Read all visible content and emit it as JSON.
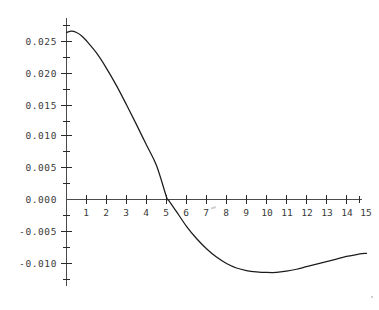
{
  "chart_data": {
    "type": "line",
    "title": "",
    "subtitle": "",
    "xlabel": "",
    "ylabel": "",
    "xlim": [
      0,
      15.2
    ],
    "ylim": [
      -0.0125,
      0.0275
    ],
    "grid": false,
    "legend": null,
    "legend_position": "none",
    "background_color": "#ffffff",
    "axis_color": "#4a4a4a",
    "tick_color": "#2a2a2a",
    "label_color": "#3a3a3a",
    "line_color": "#1c1c1c",
    "x_ticks": [
      1,
      2,
      3,
      4,
      5,
      6,
      7,
      8,
      9,
      10,
      11,
      12,
      13,
      14,
      15
    ],
    "x_tick_labels": [
      "1",
      "2",
      "3",
      "4",
      "5",
      "6",
      "7",
      "8",
      "9",
      "10",
      "11",
      "12",
      "13",
      "14",
      "15"
    ],
    "y_ticks": [
      -0.01,
      -0.005,
      0.0,
      0.005,
      0.01,
      0.015,
      0.02,
      0.025
    ],
    "y_tick_labels": [
      "-0.010",
      "-0.005",
      "0.000",
      "0.005",
      "0.010",
      "0.015",
      "0.020",
      "0.025"
    ],
    "y_minor_ticks": [
      -0.0125,
      -0.0075,
      -0.0025,
      0.0025,
      0.0075,
      0.0125,
      0.0175,
      0.0225,
      0.0265
    ],
    "zero_crossing_x": 5.1,
    "minimum": {
      "x": 10.5,
      "y": -0.0114
    },
    "maximum": {
      "x": 0.25,
      "y": 0.0263
    },
    "series": [
      {
        "name": "curve",
        "color": "#1c1c1c",
        "x": [
          0.0,
          0.25,
          0.5,
          0.75,
          1.0,
          1.5,
          2.0,
          2.5,
          3.0,
          3.5,
          4.0,
          4.5,
          5.0,
          5.1,
          5.5,
          6.0,
          6.5,
          7.0,
          7.5,
          8.0,
          8.5,
          9.0,
          9.5,
          10.0,
          10.5,
          11.0,
          11.5,
          12.0,
          12.5,
          13.0,
          13.5,
          14.0,
          14.5,
          15.0
        ],
        "y": [
          0.0261,
          0.0263,
          0.0261,
          0.0256,
          0.0248,
          0.0229,
          0.0205,
          0.0178,
          0.0148,
          0.0117,
          0.0085,
          0.0053,
          0.0004,
          -0.0001,
          -0.0019,
          -0.0042,
          -0.0061,
          -0.0077,
          -0.009,
          -0.01,
          -0.0107,
          -0.0111,
          -0.0113,
          -0.0114,
          -0.0114,
          -0.0112,
          -0.0109,
          -0.0105,
          -0.0101,
          -0.0097,
          -0.0093,
          -0.0089,
          -0.0086,
          -0.0084
        ]
      }
    ]
  },
  "artifacts": {
    "stray_mark_label": "stray-mark-near-7"
  }
}
